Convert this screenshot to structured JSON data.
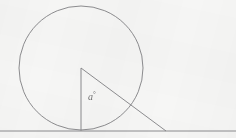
{
  "figure": {
    "background_color": "#f6f6f5",
    "stroke_color": "#808083",
    "stroke_width": 0.9,
    "width": 236,
    "height": 138,
    "angle_label": {
      "symbol": "a",
      "unit": "°",
      "text": "a°",
      "x": 88,
      "y": 91,
      "color": "#6f6f70"
    },
    "circle": {
      "name": "main-circle",
      "center_x": 81,
      "center_y": 68,
      "radius": 62,
      "fill": "none"
    },
    "baseline": {
      "name": "ground-line",
      "x1": 0,
      "y1": 131,
      "x2": 236,
      "y2": 131
    },
    "triangle": {
      "name": "radius-tangent-triangle",
      "vertices": [
        {
          "label": "center",
          "x": 81,
          "y": 68
        },
        {
          "label": "tangent-point",
          "x": 81,
          "y": 130.5
        },
        {
          "label": "external-point",
          "x": 166,
          "y": 131
        }
      ],
      "legs": [
        {
          "name": "vertical-radius",
          "x1": 81,
          "y1": 68,
          "x2": 81,
          "y2": 130.5
        },
        {
          "name": "hypotenuse",
          "x1": 81,
          "y1": 68,
          "x2": 166,
          "y2": 131
        }
      ]
    }
  },
  "chart_data": {
    "type": "diagram",
    "elements": [
      {
        "type": "circle",
        "cx": 81,
        "cy": 68,
        "r": 62
      },
      {
        "type": "line",
        "name": "baseline",
        "x1": 0,
        "y1": 131,
        "x2": 236,
        "y2": 131
      },
      {
        "type": "line",
        "name": "radius",
        "x1": 81,
        "y1": 68,
        "x2": 81,
        "y2": 130.5
      },
      {
        "type": "line",
        "name": "hypotenuse",
        "x1": 81,
        "y1": 68,
        "x2": 166,
        "y2": 131
      }
    ],
    "annotations": [
      {
        "text": "a°",
        "x": 88,
        "y": 96,
        "describes": "angle at circle centre between radius and hypotenuse"
      }
    ]
  }
}
